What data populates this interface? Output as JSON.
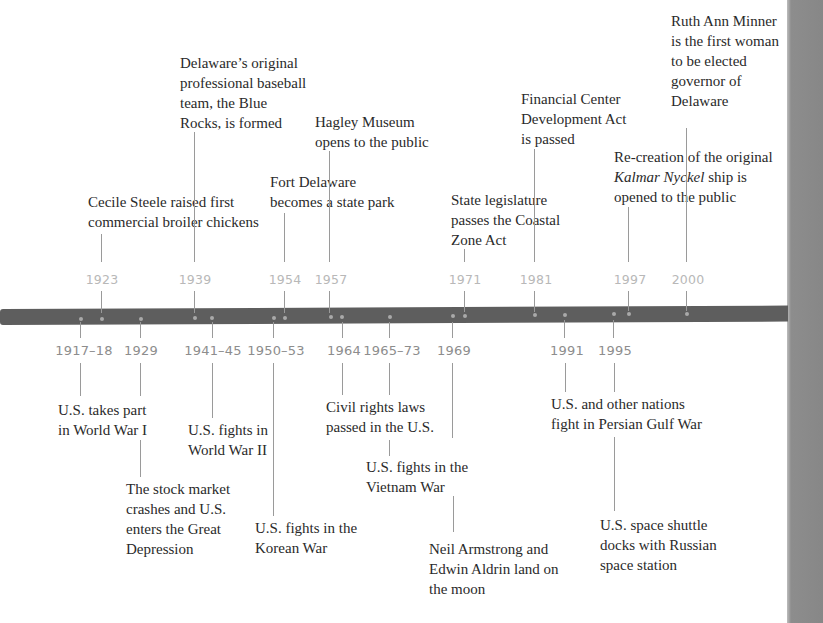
{
  "colors": {
    "bar": "#5e5e5e",
    "dot": "#a9a9a9",
    "delaware_year": "#b8b8b8",
    "us_year": "#8d8d8d",
    "text": "#2a2a2a",
    "page_edge": "#8a8a8a"
  },
  "delaware_events": [
    {
      "year": "1923",
      "text": "Cecile Steele raised first\ncommercial broiler chickens"
    },
    {
      "year": "1939",
      "text": "Delaware’s original\nprofessional baseball\nteam, the Blue\nRocks, is formed"
    },
    {
      "year": "1954",
      "text": "Fort Delaware\nbecomes a state park"
    },
    {
      "year": "1957",
      "text": "Hagley Museum\nopens to the public"
    },
    {
      "year": "1971",
      "text": "State legislature\npasses the Coastal\nZone Act"
    },
    {
      "year": "1981",
      "text": "Financial Center\nDevelopment Act\nis passed"
    },
    {
      "year": "1997",
      "text_prefix": "Re-creation of the original\n",
      "text_italic": "Kalmar Nyckel",
      "text_suffix": " ship is\nopened to the public"
    },
    {
      "year": "2000",
      "text": "Ruth Ann Minner\nis the first woman\nto be elected\ngovernor of\nDelaware"
    }
  ],
  "us_events": [
    {
      "year": "1917–18",
      "text": "U.S. takes part\nin World War I"
    },
    {
      "year": "1929",
      "text": "The stock market\ncrashes and U.S.\nenters the Great\nDepression"
    },
    {
      "year": "1941–45",
      "text": "U.S. fights in\nWorld War II"
    },
    {
      "year": "1950–53",
      "text": "U.S. fights in the\nKorean War"
    },
    {
      "year": "1964",
      "text": "Civil rights laws\npassed in the U.S."
    },
    {
      "year": "1965–73",
      "text": "U.S. fights in the\nVietnam War"
    },
    {
      "year": "1969",
      "text": "Neil Armstrong and\nEdwin Aldrin land on\nthe moon"
    },
    {
      "year": "1991",
      "text": "U.S. and other nations\nfight in Persian Gulf War"
    },
    {
      "year": "1995",
      "text": "U.S. space shuttle\ndocks with Russian\nspace station"
    }
  ]
}
